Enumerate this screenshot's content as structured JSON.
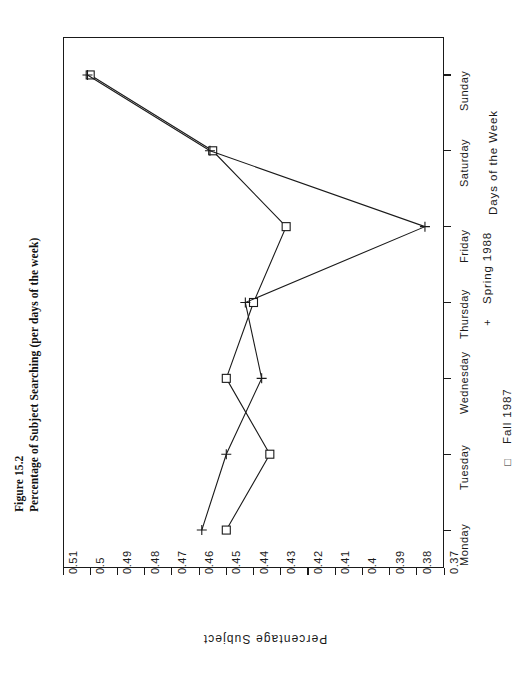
{
  "figure": {
    "number_label": "Figure 15.2",
    "caption": "Percentage of Subject Searching (per days of the week)"
  },
  "chart_data": {
    "type": "line",
    "title": "Percentage of Subject Searching (per days of the week)",
    "orientation": "rotated-90-ccw",
    "categories": [
      "Monday",
      "Tuesday",
      "Wednesday",
      "Thursday",
      "Friday",
      "Saturday",
      "Sunday"
    ],
    "xlabel": "Days of the Week",
    "ylabel": "Percentage Subject",
    "ylim": [
      0.37,
      0.51
    ],
    "ytick_labels": [
      "0.51",
      "0.5",
      "0.49",
      "0.48",
      "0.47",
      "0.46",
      "0.45",
      "0.44",
      "0.43",
      "0.42",
      "0.41",
      "0.4",
      "0.39",
      "0.38",
      "0.37"
    ],
    "ytick_values": [
      0.51,
      0.5,
      0.49,
      0.48,
      0.47,
      0.46,
      0.45,
      0.44,
      0.43,
      0.42,
      0.41,
      0.4,
      0.39,
      0.38,
      0.37
    ],
    "grid": false,
    "legend_position": "bottom-right",
    "series": [
      {
        "name": "Fall 1987",
        "marker": "square",
        "color": "#1a1a1a",
        "values": [
          0.45,
          0.434,
          0.45,
          0.44,
          0.428,
          0.455,
          0.5
        ]
      },
      {
        "name": "Spring 1988",
        "marker": "plus",
        "color": "#1a1a1a",
        "values": [
          0.459,
          0.45,
          0.437,
          0.443,
          0.377,
          0.456,
          0.501
        ]
      }
    ]
  },
  "legend": {
    "entries": [
      {
        "symbol": "□",
        "label": "Fall 1987"
      },
      {
        "symbol": "+",
        "label": "Spring 1988"
      }
    ]
  }
}
